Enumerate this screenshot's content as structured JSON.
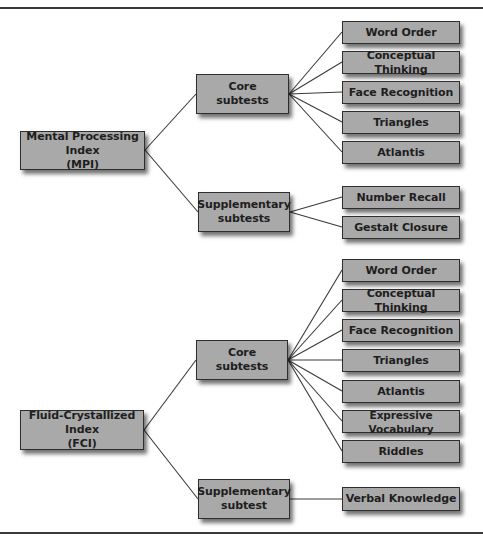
{
  "diagram": {
    "type": "tree",
    "colors": {
      "box_fill": "#a9a9a9",
      "box_border": "#2e2e2e",
      "line": "#3a3a3a",
      "background": "#ffffff"
    },
    "sections": [
      {
        "index": {
          "line1": "Mental Processing Index",
          "line2": "(MPI)"
        },
        "groups": [
          {
            "label_line1": "Core",
            "label_line2": "subtests",
            "items": [
              "Word Order",
              "Conceptual Thinking",
              "Face Recognition",
              "Triangles",
              "Atlantis"
            ]
          },
          {
            "label_line1": "Supplementary",
            "label_line2": "subtests",
            "items": [
              "Number Recall",
              "Gestalt Closure"
            ]
          }
        ]
      },
      {
        "index": {
          "line1": "Fluid-Crystallized Index",
          "line2": "(FCI)"
        },
        "groups": [
          {
            "label_line1": "Core",
            "label_line2": "subtests",
            "items": [
              "Word Order",
              "Conceptual Thinking",
              "Face Recognition",
              "Triangles",
              "Atlantis",
              "Expressive Vocabulary",
              "Riddles"
            ]
          },
          {
            "label_line1": "Supplementary",
            "label_line2": "subtest",
            "items": [
              "Verbal Knowledge"
            ]
          }
        ]
      }
    ]
  }
}
